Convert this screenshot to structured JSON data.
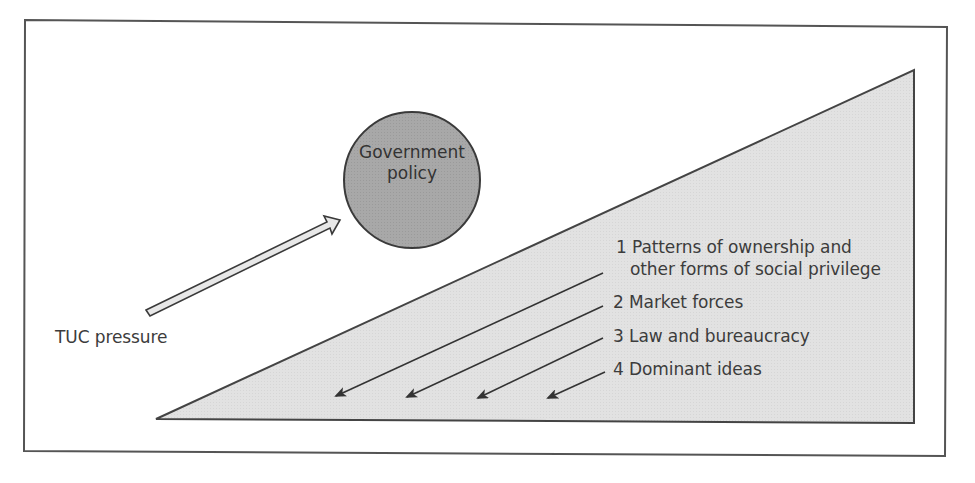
{
  "diagram": {
    "circle": {
      "line1": "Government",
      "line2": "policy",
      "fill": "#a9a9a9"
    },
    "pressure_label": "TUC pressure",
    "forces": [
      {
        "number": "1",
        "line1": "Patterns of ownership and",
        "line2": "other forms of social privilege"
      },
      {
        "number": "2",
        "line1": "Market forces"
      },
      {
        "number": "3",
        "line1": "Law and bureaucracy"
      },
      {
        "number": "4",
        "line1": "Dominant ideas"
      }
    ],
    "colors": {
      "frame_stroke": "#555555",
      "triangle_fill": "#e4e4e4",
      "arrow_fill": "#e8e8e8",
      "line": "#333333"
    },
    "caption": "Figure"
  },
  "labels": {
    "force1_line1": "1 Patterns of ownership and",
    "force1_line2": "other forms of social privilege",
    "force2": "2 Market forces",
    "force3": "3 Law and bureaucracy",
    "force4": "4 Dominant ideas"
  }
}
